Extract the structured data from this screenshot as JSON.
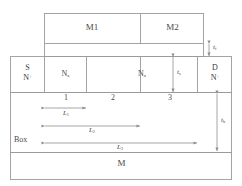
{
  "figure": {
    "type": "device-cross-section",
    "title": "",
    "background_color": "#ffffff",
    "line_color": "#9a9a9a",
    "text_color": "#4a4a4a"
  },
  "gate_stack": {
    "m1": {
      "label": "M1"
    },
    "m2": {
      "label": "M2"
    }
  },
  "body": {
    "source": {
      "label_top": "S",
      "label_bottom": "N",
      "label_bottom_sup": "+"
    },
    "drain": {
      "label_top": "D",
      "label_bottom": "N",
      "label_bottom_sup": "+"
    },
    "channel_left": {
      "label": "N",
      "label_sub": "a"
    },
    "channel_right": {
      "label": "N",
      "label_sub": "a"
    }
  },
  "region_numbers": {
    "one": "1",
    "two": "2",
    "three": "3"
  },
  "substrate": {
    "box_label": "Box",
    "metal_label": "M"
  },
  "dimensions": {
    "l1": {
      "base": "L",
      "sub": "1"
    },
    "l2": {
      "base": "L",
      "sub": "2"
    },
    "l3": {
      "base": "L",
      "sub": "3"
    },
    "tf": {
      "base": "t",
      "sub": "f"
    },
    "ts": {
      "base": "t",
      "sub": "s"
    },
    "tb": {
      "base": "t",
      "sub": "b"
    }
  }
}
